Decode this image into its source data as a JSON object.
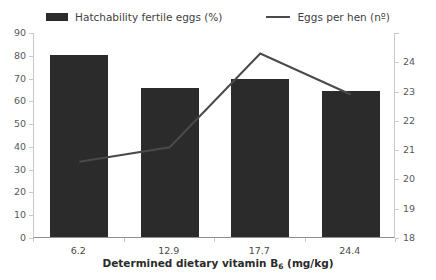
{
  "legend": {
    "position": "top-center",
    "entries": [
      {
        "label": "Hatchability fertile eggs (%)",
        "marker": "bar-swatch",
        "color": "#2b2b2b"
      },
      {
        "label": "Eggs per hen (nº)",
        "marker": "line-swatch",
        "color": "#4a4a4a"
      }
    ]
  },
  "axes": {
    "x_title_prefix": "Determined dietary vitamin B",
    "x_title_sub": "6",
    "x_title_suffix": " (mg/kg)",
    "x_title_full": "Determined dietary vitamin B6 (mg/kg)",
    "left_ticks": [
      "0",
      "10",
      "20",
      "30",
      "40",
      "50",
      "60",
      "70",
      "80",
      "90"
    ],
    "right_ticks": [
      "18",
      "19",
      "20",
      "21",
      "22",
      "23",
      "24",
      ""
    ],
    "x_categories": [
      "6.2",
      "12.9",
      "17.7",
      "24.4"
    ]
  },
  "chart_data": {
    "type": "bar",
    "title": "",
    "subtitle": "",
    "xlabel": "Determined dietary vitamin B6 (mg/kg)",
    "ylabel": "",
    "categories": [
      "6.2",
      "12.9",
      "17.7",
      "24.4"
    ],
    "grid": false,
    "legend_position": "top-center",
    "series": [
      {
        "name": "Hatchability fertile eggs (%)",
        "type": "bar",
        "axis": "left",
        "color": "#2b2b2b",
        "values": [
          80.0,
          65.5,
          69.5,
          64.0
        ],
        "ylim": [
          0,
          90
        ],
        "ytick_step": 10
      },
      {
        "name": "Eggs per hen (nº)",
        "type": "line",
        "axis": "right",
        "color": "#4a4a4a",
        "values": [
          20.6,
          21.1,
          24.3,
          22.9
        ],
        "ylim": [
          18,
          25
        ],
        "ytick_step": 1
      }
    ]
  },
  "colors": {
    "bar": "#2b2b2b",
    "line": "#4a4a4a",
    "axis": "#c9c9c9",
    "baseline": "#8f8f8f",
    "text": "#595959",
    "background": "#ffffff"
  }
}
